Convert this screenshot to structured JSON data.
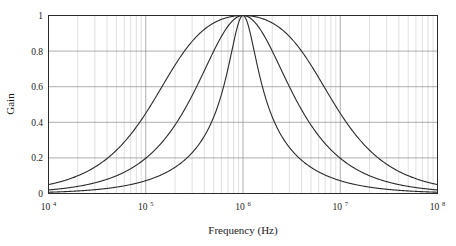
{
  "figure": {
    "type": "line-chart",
    "background_color": "#ffffff",
    "frame_color": "#2b2b2b",
    "grid_minor_color": "#c9c9c9",
    "grid_major_color": "#8d8d8d",
    "curve_color": "#2a2a2a"
  },
  "axes": {
    "x_title": "Frequency (Hz)",
    "y_title": "Gain",
    "x_tick_labels": [
      "10",
      "10",
      "10",
      "10",
      "10"
    ],
    "x_tick_exponents": [
      "4",
      "5",
      "6",
      "7",
      "8"
    ],
    "x_tick_values": [
      10000,
      100000,
      1000000,
      10000000,
      100000000
    ],
    "y_tick_labels": [
      "0",
      "0.2",
      "0.4",
      "0.6",
      "0.8",
      "1"
    ],
    "y_tick_values": [
      0,
      0.2,
      0.4,
      0.6,
      0.8,
      1
    ]
  },
  "chart_data": {
    "type": "line",
    "title": "",
    "subtitle": "",
    "xlabel": "Frequency (Hz)",
    "ylabel": "Gain",
    "xscale": "log",
    "yscale": "linear",
    "xlim": [
      10000,
      100000000
    ],
    "ylim": [
      0,
      1
    ],
    "grid": true,
    "grid_minor": true,
    "legend": "none",
    "annotations": [],
    "x_tick_labels": [
      "10^4",
      "10^5",
      "10^6",
      "10^7",
      "10^8"
    ],
    "y_tick_labels": [
      "0",
      "0.2",
      "0.4",
      "0.6",
      "0.8",
      "1"
    ],
    "center_frequency_hz": 1000000,
    "peak_gain": 1,
    "series": [
      {
        "name": "broad-resonance-low-q",
        "q_factor": 0.2,
        "center_hz": 1000000,
        "x": [
          10000,
          14678,
          21544,
          31623,
          46416,
          68129,
          100000,
          146780,
          215443,
          316228,
          464159,
          681292,
          1000000,
          1467799,
          2154435,
          3162278,
          4641589,
          6812921,
          10000000,
          14677993,
          21544347,
          31622777,
          46415888,
          68129207,
          100000000
        ],
        "y": [
          0.03,
          0.044,
          0.065,
          0.095,
          0.14,
          0.205,
          0.298,
          0.421,
          0.569,
          0.721,
          0.862,
          0.96,
          1.0,
          0.96,
          0.862,
          0.721,
          0.569,
          0.421,
          0.298,
          0.205,
          0.14,
          0.095,
          0.065,
          0.044,
          0.03
        ]
      },
      {
        "name": "medium-resonance-mid-q",
        "q_factor": 0.5,
        "center_hz": 1000000,
        "x": [
          10000,
          14678,
          21544,
          31623,
          46416,
          68129,
          100000,
          146780,
          215443,
          316228,
          464159,
          681292,
          1000000,
          1467799,
          2154435,
          3162278,
          4641589,
          6812921,
          10000000,
          14677993,
          21544347,
          31622777,
          46415888,
          68129207,
          100000000
        ],
        "y": [
          0.02,
          0.029,
          0.043,
          0.063,
          0.093,
          0.137,
          0.202,
          0.294,
          0.42,
          0.581,
          0.759,
          0.918,
          1.0,
          0.918,
          0.759,
          0.581,
          0.42,
          0.294,
          0.202,
          0.137,
          0.093,
          0.063,
          0.043,
          0.029,
          0.02
        ]
      },
      {
        "name": "narrow-resonance-high-q",
        "q_factor": 1.4,
        "center_hz": 1000000,
        "x": [
          10000,
          14678,
          21544,
          31623,
          46416,
          68129,
          100000,
          146780,
          215443,
          316228,
          464159,
          681292,
          1000000,
          1467799,
          2154435,
          3162278,
          4641589,
          6812921,
          10000000,
          14677993,
          21544347,
          31622777,
          46415888,
          68129207,
          100000000
        ],
        "y": [
          0.007,
          0.01,
          0.015,
          0.023,
          0.034,
          0.05,
          0.074,
          0.11,
          0.163,
          0.243,
          0.372,
          0.591,
          1.0,
          0.591,
          0.372,
          0.243,
          0.163,
          0.11,
          0.074,
          0.05,
          0.034,
          0.023,
          0.015,
          0.01,
          0.007
        ]
      }
    ]
  }
}
